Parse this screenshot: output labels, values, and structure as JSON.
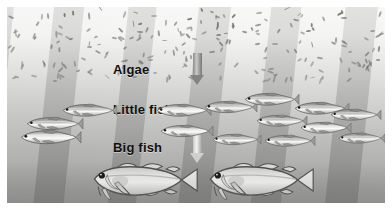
{
  "figure": {
    "background_colors": {
      "water_top": "#f2f2f1",
      "water_bottom": "#8e8e8c",
      "ray_light": "#ffffff",
      "ray_dark": "#6e6e6c",
      "algae_mark": "#6e6e6c",
      "text": "#101010",
      "frame": "#ffffff"
    }
  },
  "labels": {
    "algae": "Algae",
    "little_fish": "Little fish",
    "big_fish": "Big fish"
  },
  "arrows": [
    {
      "name": "algae-to-little-fish",
      "direction": "down",
      "from": "Algae",
      "to": "Little fish",
      "color": "#838381"
    },
    {
      "name": "little-fish-to-big-fish",
      "direction": "down",
      "from": "Little fish",
      "to": "Big fish",
      "color": "#cfcfcd"
    }
  ],
  "trophic_levels": [
    {
      "name": "Algae",
      "count_depicted": "many (scattered particles)",
      "row": 1
    },
    {
      "name": "Little fish",
      "count_depicted": 14,
      "row": 2
    },
    {
      "name": "Big fish",
      "count_depicted": 2,
      "row": 3
    }
  ],
  "little_fish": [
    {
      "x": 18,
      "y": 108,
      "w": 58,
      "flip": false,
      "tone": "mid"
    },
    {
      "x": 12,
      "y": 121,
      "w": 62,
      "flip": false,
      "tone": "light"
    },
    {
      "x": 54,
      "y": 95,
      "w": 56,
      "flip": false,
      "tone": "mid"
    },
    {
      "x": 148,
      "y": 95,
      "w": 56,
      "flip": false,
      "tone": "light"
    },
    {
      "x": 152,
      "y": 116,
      "w": 54,
      "flip": false,
      "tone": "light"
    },
    {
      "x": 196,
      "y": 92,
      "w": 54,
      "flip": false,
      "tone": "mid"
    },
    {
      "x": 204,
      "y": 125,
      "w": 50,
      "flip": false,
      "tone": "mid"
    },
    {
      "x": 236,
      "y": 84,
      "w": 56,
      "flip": false,
      "tone": "mid"
    },
    {
      "x": 248,
      "y": 106,
      "w": 52,
      "flip": false,
      "tone": "mid"
    },
    {
      "x": 256,
      "y": 126,
      "w": 52,
      "flip": false,
      "tone": "mid"
    },
    {
      "x": 286,
      "y": 93,
      "w": 56,
      "flip": false,
      "tone": "mid"
    },
    {
      "x": 292,
      "y": 113,
      "w": 52,
      "flip": false,
      "tone": "light"
    },
    {
      "x": 322,
      "y": 100,
      "w": 52,
      "flip": false,
      "tone": "mid"
    },
    {
      "x": 330,
      "y": 124,
      "w": 48,
      "flip": false,
      "tone": "mid"
    }
  ],
  "big_fish": [
    {
      "x": 82,
      "y": 152,
      "w": 110,
      "label": "cod"
    },
    {
      "x": 198,
      "y": 152,
      "w": 110,
      "label": "cod"
    }
  ],
  "algae_marks_count": 210
}
